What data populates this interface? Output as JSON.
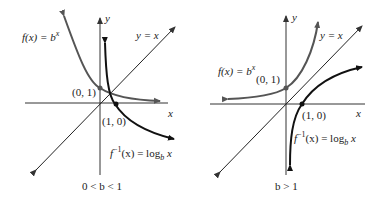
{
  "colors": {
    "exp_curve": "#555555",
    "log_curve": "#111111",
    "axes": "#333333",
    "identity_line": "#222222",
    "text": "#222222"
  },
  "panels": [
    {
      "id": "left",
      "condition": "0 < b < 1",
      "exp_label": "f(x) = b^x",
      "log_label": "f^-1(x) = log_b x",
      "identity_label": "y = x",
      "x_axis_label": "x",
      "y_axis_label": "y",
      "point_exp": "(0, 1)",
      "point_log": "(1, 0)"
    },
    {
      "id": "right",
      "condition": "b > 1",
      "exp_label": "f(x) = b^x",
      "log_label": "f^-1(x) = log_b x",
      "identity_label": "y = x",
      "x_axis_label": "x",
      "y_axis_label": "y",
      "point_exp": "(0, 1)",
      "point_log": "(1, 0)"
    }
  ],
  "text": {
    "left": {
      "fx": "f(x) = b",
      "fx_exp": "x",
      "finv_f": "f",
      "finv_sup": "−1",
      "finv_rest": "(x) = log",
      "finv_sub": "b",
      "finv_x": " x",
      "yx": "y = x",
      "x": "x",
      "y": "y",
      "p01": "(0, 1)",
      "p10": "(1, 0)",
      "cond": "0 < b < 1"
    },
    "right": {
      "fx": "f(x) = b",
      "fx_exp": "x",
      "finv_f": "f",
      "finv_sup": "−1",
      "finv_rest": "(x) = log",
      "finv_sub": "b",
      "finv_x": " x",
      "yx": "y = x",
      "x": "x",
      "y": "y",
      "p01": "(0, 1)",
      "p10": "(1, 0)",
      "cond": "b > 1"
    }
  }
}
